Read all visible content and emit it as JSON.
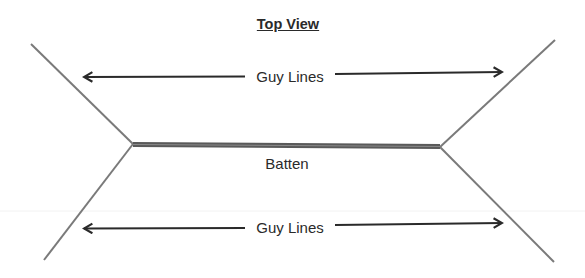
{
  "diagram": {
    "title": "Top View",
    "labels": {
      "top_arrow": "Guy Lines",
      "batten": "Batten",
      "bottom_arrow": "Guy Lines"
    },
    "colors": {
      "guy_line": "#7a7a7a",
      "batten": "#5a5a5a",
      "arrow": "#2a2a2a",
      "text": "#2a2a2a"
    }
  }
}
